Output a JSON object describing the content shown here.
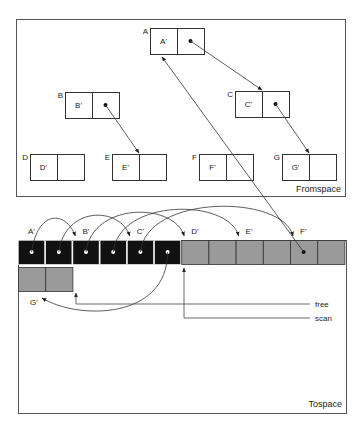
{
  "fromspace": {
    "label": "Fromspace",
    "objects": [
      {
        "id": "A",
        "label": "A",
        "forward": "A'",
        "has_pointer": true
      },
      {
        "id": "B",
        "label": "B",
        "forward": "B'",
        "has_pointer": true
      },
      {
        "id": "C",
        "label": "C",
        "forward": "C'",
        "has_pointer": true
      },
      {
        "id": "D",
        "label": "D",
        "forward": "D'",
        "has_pointer": false
      },
      {
        "id": "E",
        "label": "E",
        "forward": "E'",
        "has_pointer": false
      },
      {
        "id": "F",
        "label": "F",
        "forward": "F'",
        "has_pointer": false
      },
      {
        "id": "G",
        "label": "G",
        "forward": "G'",
        "has_pointer": false
      }
    ],
    "edges": [
      {
        "from": "A",
        "to": "C"
      },
      {
        "from": "B",
        "to": "E"
      },
      {
        "from": "C",
        "to": "G"
      }
    ]
  },
  "tospace": {
    "label": "Tospace",
    "copies": [
      {
        "label": "A'",
        "state": "scanned"
      },
      {
        "label": "B'",
        "state": "scanned"
      },
      {
        "label": "C'",
        "state": "scanned"
      },
      {
        "label": "D'",
        "state": "copied"
      },
      {
        "label": "E'",
        "state": "copied"
      },
      {
        "label": "F'",
        "state": "copied"
      },
      {
        "label": "G'",
        "state": "copied"
      }
    ],
    "pointers": {
      "free": "free",
      "scan": "scan"
    }
  },
  "colors": {
    "scanned": "#111111",
    "copied": "#9a9a9a",
    "line": "#333333"
  }
}
